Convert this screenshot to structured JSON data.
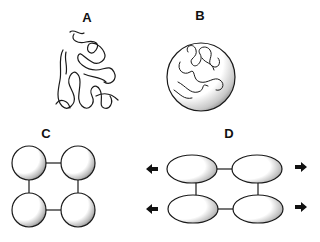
{
  "panels": [
    {
      "id": "A",
      "label": "A",
      "description": "Random coil chain"
    },
    {
      "id": "B",
      "label": "B",
      "description": "Coiled chain enclosed in sphere"
    },
    {
      "id": "C",
      "label": "C",
      "description": "Four linked spheres"
    },
    {
      "id": "D",
      "label": "D",
      "description": "Four linked ellipsoids stretched"
    }
  ],
  "colors": {
    "stroke": "#1a1a1a",
    "background": "#ffffff"
  }
}
